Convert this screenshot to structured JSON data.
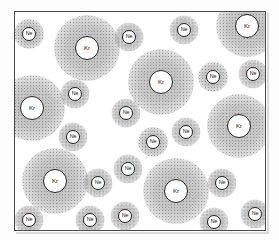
{
  "figure": {
    "container_label": "container-box",
    "background_color": "#ffffff",
    "frame_color": "#4a4a4a",
    "halo_color": "#8c8c8c",
    "core_fill": "#ffffff",
    "core_stroke": "#1f1f1f"
  },
  "species": [
    {
      "key": "ne",
      "symbol": "Ne",
      "name": "neon",
      "core_diameter": 14,
      "halo_diameter": 30
    },
    {
      "key": "kr",
      "symbol": "Kr",
      "name": "krypton",
      "core_diameter": 24,
      "halo_diameter": 66
    }
  ],
  "counts": {
    "Ne": 22,
    "Kr": 7,
    "total": 29
  },
  "atoms": [
    {
      "symbol": "Ne",
      "species": "ne",
      "x": 28,
      "y": 33,
      "halo": 30
    },
    {
      "symbol": "Kr",
      "species": "kr",
      "x": 86,
      "y": 47,
      "halo": 66
    },
    {
      "symbol": "Ne",
      "species": "ne",
      "x": 128,
      "y": 36,
      "halo": 29
    },
    {
      "symbol": "Ne",
      "species": "ne",
      "x": 183,
      "y": 29,
      "halo": 29
    },
    {
      "symbol": "Kr",
      "species": "kr",
      "x": 246,
      "y": 25,
      "halo": 62
    },
    {
      "symbol": "Kr",
      "species": "kr",
      "x": 160,
      "y": 81,
      "halo": 66
    },
    {
      "symbol": "Ne",
      "species": "ne",
      "x": 212,
      "y": 76,
      "halo": 30
    },
    {
      "symbol": "Ne",
      "species": "ne",
      "x": 252,
      "y": 73,
      "halo": 29
    },
    {
      "symbol": "Kr",
      "species": "kr",
      "x": 31,
      "y": 107,
      "halo": 66
    },
    {
      "symbol": "Ne",
      "species": "ne",
      "x": 74,
      "y": 93,
      "halo": 29
    },
    {
      "symbol": "Ne",
      "species": "ne",
      "x": 125,
      "y": 112,
      "halo": 29
    },
    {
      "symbol": "Kr",
      "species": "kr",
      "x": 238,
      "y": 125,
      "halo": 64
    },
    {
      "symbol": "Ne",
      "species": "ne",
      "x": 185,
      "y": 131,
      "halo": 29
    },
    {
      "symbol": "Ne",
      "species": "ne",
      "x": 72,
      "y": 136,
      "halo": 29
    },
    {
      "symbol": "Ne",
      "species": "ne",
      "x": 152,
      "y": 141,
      "halo": 30
    },
    {
      "symbol": "Ne",
      "species": "ne",
      "x": 127,
      "y": 168,
      "halo": 29
    },
    {
      "symbol": "Kr",
      "species": "kr",
      "x": 54,
      "y": 180,
      "halo": 66
    },
    {
      "symbol": "Ne",
      "species": "ne",
      "x": 97,
      "y": 182,
      "halo": 29
    },
    {
      "symbol": "Kr",
      "species": "kr",
      "x": 175,
      "y": 190,
      "halo": 66
    },
    {
      "symbol": "Ne",
      "species": "ne",
      "x": 221,
      "y": 182,
      "halo": 29
    },
    {
      "symbol": "Ne",
      "species": "ne",
      "x": 28,
      "y": 219,
      "halo": 29
    },
    {
      "symbol": "Ne",
      "species": "ne",
      "x": 89,
      "y": 219,
      "halo": 29
    },
    {
      "symbol": "Ne",
      "species": "ne",
      "x": 124,
      "y": 215,
      "halo": 29
    },
    {
      "symbol": "Ne",
      "species": "ne",
      "x": 213,
      "y": 221,
      "halo": 29
    },
    {
      "symbol": "Ne",
      "species": "ne",
      "x": 254,
      "y": 213,
      "halo": 29
    }
  ]
}
